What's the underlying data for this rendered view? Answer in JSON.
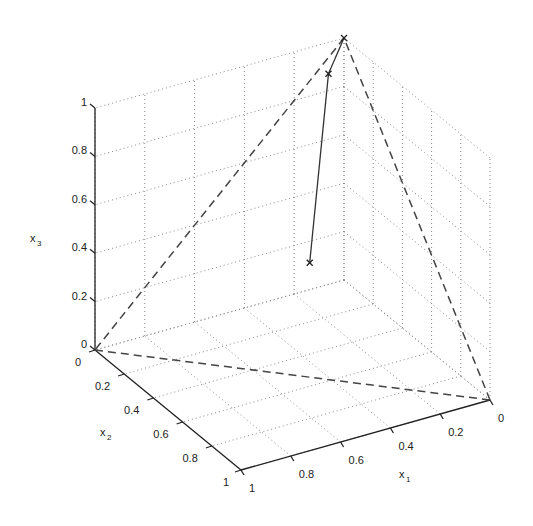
{
  "chart_data": {
    "type": "line",
    "subtype": "3d-simplex-plot",
    "title": "",
    "xlabel": "x1",
    "ylabel": "x2",
    "zlabel": "x3",
    "axes": {
      "x1": {
        "range": [
          0,
          1
        ],
        "ticks": [
          0,
          0.2,
          0.4,
          0.6,
          0.8,
          1
        ],
        "tick_labels": [
          "0",
          "0.2",
          "0.4",
          "0.6",
          "0.8",
          "1"
        ]
      },
      "x2": {
        "range": [
          0,
          1
        ],
        "ticks": [
          0,
          0.2,
          0.4,
          0.6,
          0.8,
          1
        ],
        "tick_labels": [
          "0",
          "0.2",
          "0.4",
          "0.6",
          "0.8",
          "1"
        ]
      },
      "x3": {
        "range": [
          0,
          1
        ],
        "ticks": [
          0,
          0.2,
          0.4,
          0.6,
          0.8,
          1
        ],
        "tick_labels": [
          "0",
          "0.2",
          "0.4",
          "0.6",
          "0.8",
          "1"
        ]
      }
    },
    "grid": true,
    "grid_style": "dotted",
    "series": [
      {
        "name": "simplex",
        "style": "dashed",
        "closed": true,
        "points": [
          [
            0,
            0,
            1
          ],
          [
            1,
            0,
            0
          ],
          [
            0,
            1,
            0
          ]
        ]
      },
      {
        "name": "trajectory",
        "style": "solid",
        "marker": "x",
        "points": [
          [
            0.333,
            0.333,
            0.333
          ],
          [
            0.08,
            0.03,
            0.89
          ],
          [
            0,
            0,
            1
          ]
        ]
      }
    ],
    "legend": null
  },
  "labels": {
    "x1": "x",
    "x1_sub": "1",
    "x2": "x",
    "x2_sub": "2",
    "x3": "x",
    "x3_sub": "3"
  }
}
